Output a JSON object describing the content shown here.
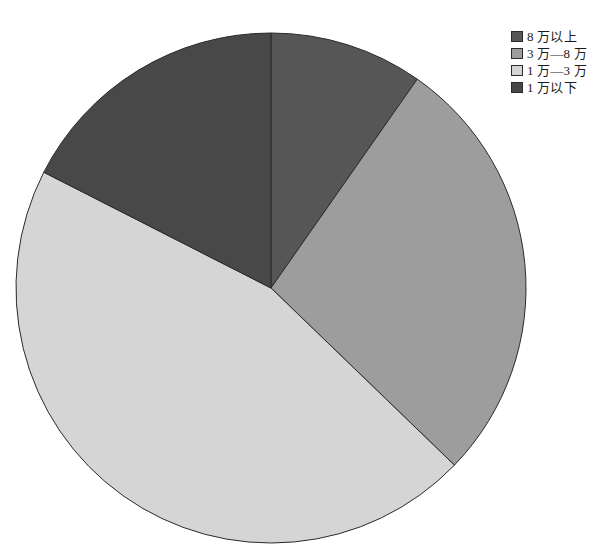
{
  "chart_data": {
    "type": "pie",
    "title": "",
    "subtitle": "",
    "xlabel": "",
    "ylabel": "",
    "grid": false,
    "legend_position": "top-right",
    "start_angle_deg": 0,
    "direction": "clockwise",
    "center": {
      "x": 271,
      "y": 288
    },
    "radius": 255,
    "categories": [
      "8 万以上",
      "3 万—8 万",
      "1 万—3 万",
      "1 万以下"
    ],
    "values": [
      9.7,
      27.5,
      45.3,
      17.5
    ],
    "value_unit": "%",
    "slices": [
      {
        "label": "8 万以上",
        "value": 9.7,
        "start_deg": 0,
        "end_deg": 35,
        "color": "#565656",
        "edge_color": "#2b2b2b"
      },
      {
        "label": "3 万—8 万",
        "value": 27.5,
        "start_deg": 35,
        "end_deg": 134,
        "color": "#9d9d9d",
        "edge_color": "#2b2b2b"
      },
      {
        "label": "1 万—3 万",
        "value": 45.3,
        "start_deg": 134,
        "end_deg": 297,
        "color": "#d5d5d5",
        "edge_color": "#2b2b2b"
      },
      {
        "label": "1 万以下",
        "value": 17.5,
        "start_deg": 297,
        "end_deg": 360,
        "color": "#484848",
        "edge_color": "#2b2b2b"
      }
    ]
  },
  "legend": {
    "items": [
      {
        "label": "8 万以上",
        "color": "#565656"
      },
      {
        "label": "3 万—8 万",
        "color": "#9d9d9d"
      },
      {
        "label": "1 万—3 万",
        "color": "#d5d5d5"
      },
      {
        "label": "1 万以下",
        "color": "#484848"
      }
    ]
  },
  "colors": {
    "background": "#ffffff",
    "outline": "#2b2b2b",
    "text": "#1a1a1a"
  }
}
